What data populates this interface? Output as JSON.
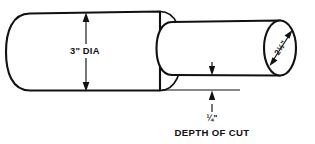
{
  "drawing": {
    "title": "Stepped shaft turning diagram",
    "labels": {
      "large_diameter": "3\" DIA",
      "small_diameter": "2½\"",
      "depth_value": "¼\"",
      "depth_caption": "DEPTH OF CUT"
    },
    "colors": {
      "line": "#111111",
      "background": "#ffffff",
      "text": "#111111"
    },
    "dimensions": {
      "large_diameter_value": "3",
      "large_diameter_unit": "in",
      "small_diameter_value": "2.5",
      "small_diameter_unit": "in",
      "depth_of_cut_value": "0.25",
      "depth_of_cut_unit": "in"
    }
  }
}
